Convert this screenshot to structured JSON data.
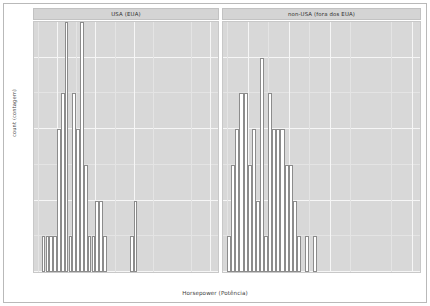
{
  "chart_data": {
    "type": "bar",
    "title": "",
    "subtitle": "",
    "xlabel": "Horsepower (Potência)",
    "ylabel": "count (contagem)",
    "grid": true,
    "legend": null,
    "facet_variable": "origin",
    "binwidth": 10,
    "xlim": [
      40,
      520
    ],
    "ylim": [
      0,
      7
    ],
    "xticks": [
      100,
      200,
      300,
      500
    ],
    "yticks": [
      0,
      2,
      4,
      6
    ],
    "panels": [
      {
        "label": "USA (EUA)",
        "x": [
          65,
          75,
          85,
          95,
          105,
          115,
          125,
          135,
          145,
          155,
          165,
          175,
          185,
          195,
          205,
          215,
          225,
          295,
          305
        ],
        "values": [
          1,
          1,
          1,
          1,
          4,
          5,
          7,
          1,
          5,
          4,
          7,
          3,
          1,
          1,
          2,
          2,
          1,
          1,
          2
        ]
      },
      {
        "label": "non-USA (fora dos EUA)",
        "x": [
          55,
          65,
          75,
          85,
          95,
          105,
          115,
          125,
          135,
          145,
          155,
          165,
          175,
          185,
          195,
          205,
          215,
          225,
          245,
          265,
          495
        ],
        "values": [
          1,
          3,
          4,
          5,
          5,
          3,
          4,
          2,
          6,
          1,
          5,
          4,
          4,
          4,
          3,
          3,
          2,
          1,
          1,
          1,
          0
        ]
      }
    ]
  },
  "axes": {
    "y_title": "count (contagem)",
    "x_title": "Horsepower (Potência)",
    "y_tick_labels": [
      "0",
      "2",
      "4",
      "6"
    ],
    "x_tick_labels_left": [
      "100",
      "200",
      "300"
    ],
    "x_tick_labels_right": [
      "100",
      "200",
      "300",
      "500"
    ]
  },
  "panel_left": {
    "strip_label": "USA (EUA)"
  },
  "panel_right": {
    "strip_label": "non-USA (fora dos EUA)"
  },
  "colors": {
    "panel_fill": "#d8d8d8",
    "strip_fill": "#d4d4d4",
    "bar_fill": "#ffffff",
    "bar_stroke": "#8c8c8c",
    "grid_major": "#f6f6f6",
    "grid_minor": "#e4e4e4",
    "text": "#3c3c3c"
  }
}
